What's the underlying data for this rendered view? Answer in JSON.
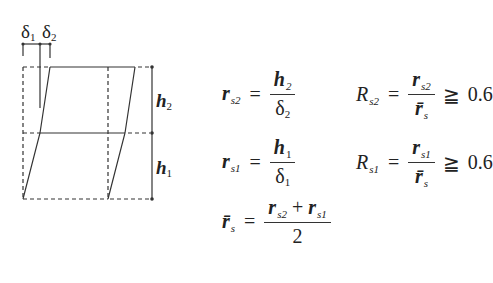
{
  "diagram": {
    "labels": {
      "delta1": {
        "sym": "δ",
        "sub": "1"
      },
      "delta2": {
        "sym": "δ",
        "sub": "2"
      },
      "h2": {
        "sym": "h",
        "sub": "2"
      },
      "h1": {
        "sym": "h",
        "sub": "1"
      }
    },
    "colors": {
      "line": "#333333",
      "background": "#ffffff"
    }
  },
  "equations": {
    "rs2": {
      "lhs": "r",
      "lhs_sub": "s2",
      "op": "=",
      "num": "h",
      "num_sub": "2",
      "den": "δ",
      "den_sub": "2"
    },
    "Rs2": {
      "lhs": "R",
      "lhs_sub": "s2",
      "op": "=",
      "num": "r",
      "num_sub": "s2",
      "den": "r̄",
      "den_sub": "s",
      "rel": "≧",
      "value": "0.6"
    },
    "rs1": {
      "lhs": "r",
      "lhs_sub": "s1",
      "op": "=",
      "num": "h",
      "num_sub": "1",
      "den": "δ",
      "den_sub": "1"
    },
    "Rs1": {
      "lhs": "R",
      "lhs_sub": "s1",
      "op": "=",
      "num": "r",
      "num_sub": "s1",
      "den": "r̄",
      "den_sub": "s",
      "rel": "≧",
      "value": "0.6"
    },
    "rbar": {
      "lhs": "r̄",
      "lhs_sub": "s",
      "op": "=",
      "num_a": "r",
      "num_a_sub": "s2",
      "plus": "+",
      "num_b": "r",
      "num_b_sub": "s1",
      "den": "2"
    }
  }
}
